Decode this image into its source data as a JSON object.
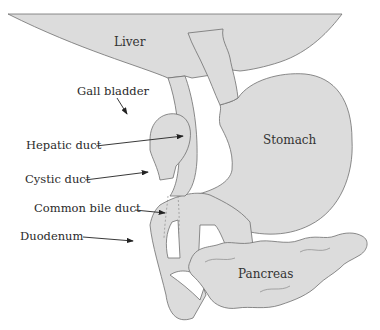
{
  "diagram": {
    "type": "anatomical-illustration",
    "fill_color": "#dcdcdc",
    "stroke_color": "#6e6e6e",
    "organs": [
      {
        "id": "liver",
        "label": "Liver"
      },
      {
        "id": "stomach",
        "label": "Stomach"
      },
      {
        "id": "pancreas",
        "label": "Pancreas"
      }
    ],
    "callouts": [
      {
        "id": "gall-bladder",
        "label": "Gall bladder"
      },
      {
        "id": "hepatic-duct",
        "label": "Hepatic duct"
      },
      {
        "id": "cystic-duct",
        "label": "Cystic duct"
      },
      {
        "id": "common-bile-duct",
        "label": "Common bile duct"
      },
      {
        "id": "duodenum",
        "label": "Duodenum"
      }
    ]
  }
}
